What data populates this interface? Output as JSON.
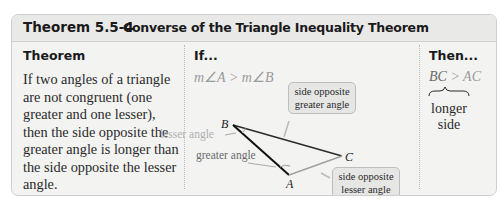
{
  "header": {
    "number": "Theorem 5.5-4",
    "title": "Converse of the Triangle Inequality Theorem"
  },
  "columns": {
    "theorem": "Theorem",
    "if": "If...",
    "then": "Then..."
  },
  "statement": "If two angles of a triangle are not congruent (one greater and one lesser), then the side opposite the greater angle is longer than the side opposite the lesser angle.",
  "if_expression": "m∠A > m∠B",
  "then_expression": {
    "left": "BC",
    "rest": " > AC",
    "brace_label": "longer side"
  },
  "diagram": {
    "vertices": {
      "A": "A",
      "B": "B",
      "C": "C"
    },
    "labels": {
      "lesser_angle": "lesser angle",
      "greater_angle": "greater angle"
    },
    "callouts": {
      "greater": "side opposite greater angle",
      "lesser": "side opposite lesser angle"
    }
  },
  "colors": {
    "box_bg": "#f3f3f2",
    "header_bg": "#e9e9e8",
    "border": "#cfcfcf",
    "muted_text": "#9a9a9a"
  }
}
